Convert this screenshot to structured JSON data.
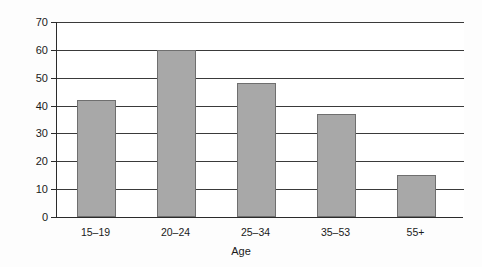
{
  "chart_data": {
    "type": "bar",
    "title": "",
    "subtitle": "",
    "xlabel": "Age",
    "ylabel": "Percentage",
    "categories": [
      "15–19",
      "20–24",
      "25–34",
      "35–53",
      "55+"
    ],
    "values": [
      42,
      60,
      48,
      37,
      15
    ],
    "series": [
      {
        "name": "Percentage",
        "values": [
          42,
          60,
          48,
          37,
          15
        ]
      }
    ],
    "ylim": [
      0,
      70
    ],
    "yticks": [
      0,
      10,
      20,
      30,
      40,
      50,
      60,
      70
    ],
    "ytick_labels": [
      "0",
      "10",
      "20",
      "30",
      "40",
      "50",
      "60",
      "70"
    ],
    "grid": "horizontal",
    "legend": "none",
    "legend_position": "none",
    "bar_fill_color": "#a8a8a8",
    "bar_edge_color": "#6f6f6f",
    "gridline_color": "#3a3a3a",
    "axis_color": "#2b2b2b",
    "background_color": "#ffffff"
  }
}
